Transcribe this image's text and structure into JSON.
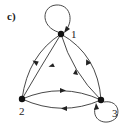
{
  "panel_label": "c)",
  "nodes": [
    {
      "id": "1",
      "label": "1",
      "x": 61,
      "y": 34
    },
    {
      "id": "2",
      "label": "2",
      "x": 22,
      "y": 99
    },
    {
      "id": "3",
      "label": "3",
      "x": 101,
      "y": 100
    }
  ],
  "edges": [
    {
      "from": "1",
      "to": "1",
      "type": "self-loop"
    },
    {
      "from": "3",
      "to": "3",
      "type": "self-loop"
    },
    {
      "from": "2",
      "to": "1",
      "type": "outer-arc"
    },
    {
      "from": "1",
      "to": "2",
      "type": "inner-arc"
    },
    {
      "from": "1",
      "to": "3",
      "type": "outer-arc"
    },
    {
      "from": "3",
      "to": "1",
      "type": "inner-arc"
    },
    {
      "from": "2",
      "to": "3",
      "type": "upper-arc"
    },
    {
      "from": "3",
      "to": "2",
      "type": "lower-arc"
    }
  ],
  "colors": {
    "stroke": "#333333",
    "node": "#111111",
    "background": "#ffffff"
  }
}
